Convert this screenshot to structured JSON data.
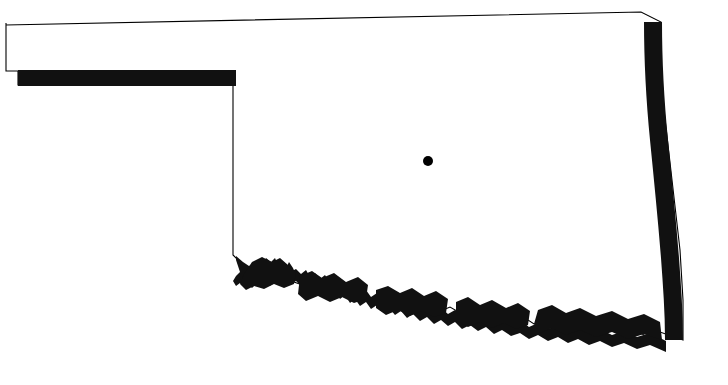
{
  "map": {
    "subject": "Oklahoma",
    "type": "state-outline-silhouette",
    "background_color": "#ffffff",
    "outline_color": "#000000",
    "fill_color": "#ffffff",
    "thick_boundary_color": "#111111",
    "marker": {
      "name": "capital-dot",
      "shape": "filled-circle",
      "color": "#000000",
      "x": 428,
      "y": 161,
      "radius": 5
    },
    "features": [
      {
        "name": "panhandle",
        "description": "narrow western rectangular extension"
      },
      {
        "name": "northern-border",
        "description": "thin straight line sloping gently upward to the east"
      },
      {
        "name": "panhandle-southern-border",
        "description": "thick filled horizontal band along the Texas line"
      },
      {
        "name": "western-border",
        "description": "thin vertical line descending from panhandle corner"
      },
      {
        "name": "red-river-border",
        "description": "thick irregular meandering southern boundary"
      },
      {
        "name": "eastern-border",
        "description": "thick filled vertical band curving along the Arkansas line"
      }
    ],
    "labels": [],
    "legend": [],
    "scale_bar": null,
    "compass": null,
    "title": ""
  }
}
